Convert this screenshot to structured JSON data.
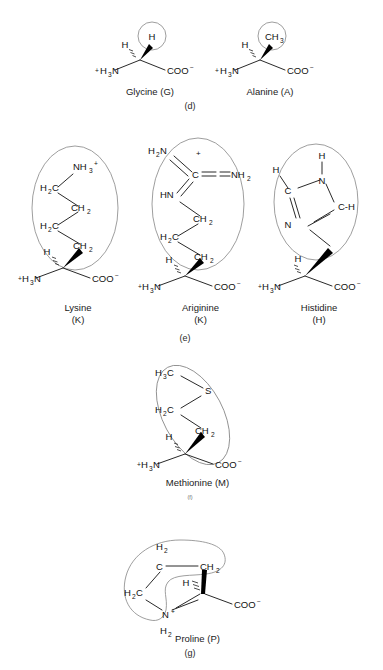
{
  "figure": {
    "background_color": "#ffffff",
    "ink_color": "#111111",
    "outline_color": "#8c8c8c"
  },
  "panels": [
    {
      "id": "d",
      "label": "(d)",
      "group": "Nonpolar / small side chains"
    },
    {
      "id": "e",
      "label": "(e)",
      "group": "Basic side chains"
    },
    {
      "id": "f",
      "label": "(f)",
      "group": "Sulfur-containing side chain"
    },
    {
      "id": "g",
      "label": "(g)",
      "group": "Cyclic imino acid"
    }
  ],
  "molecules": [
    {
      "id": "glycine",
      "name": "Glycine",
      "code": "G",
      "caption": "Glycine (G)",
      "panel": "d",
      "amino_group": "H3N",
      "amino_charge": "+",
      "carboxyl_group": "COO",
      "carboxyl_charge": "−",
      "alpha_hydrogen": "H",
      "side_chain": "H",
      "side_chain_shape": "circle"
    },
    {
      "id": "alanine",
      "name": "Alanine",
      "code": "A",
      "caption": "Alanine (A)",
      "panel": "d",
      "amino_group": "H3N",
      "amino_charge": "+",
      "carboxyl_group": "COO",
      "carboxyl_charge": "−",
      "alpha_hydrogen": "H",
      "side_chain": "CH3",
      "side_chain_shape": "circle"
    },
    {
      "id": "lysine",
      "name": "Lysine",
      "code": "K",
      "caption_line1": "Lysine",
      "caption_line2": "(K)",
      "panel": "e",
      "amino_group": "H3N",
      "amino_charge": "+",
      "carboxyl_group": "COO",
      "carboxyl_charge": "−",
      "alpha_hydrogen": "H",
      "side_chain_shape": "ellipse",
      "side_chain_atoms": [
        "NH3+",
        "H2C",
        "CH2",
        "H2C",
        "CH2"
      ]
    },
    {
      "id": "arginine",
      "name": "Ariginine",
      "code": "K",
      "caption_line1": "Ariginine",
      "caption_line2": "(K)",
      "panel": "e",
      "amino_group": "H3N",
      "amino_charge": "+",
      "carboxyl_group": "COO",
      "carboxyl_charge": "−",
      "alpha_hydrogen": "H",
      "side_chain_shape": "ellipse",
      "side_chain_atoms": [
        "H2N",
        "+",
        "C",
        "NH2",
        "HN",
        "CH2",
        "H2C",
        "CH2"
      ]
    },
    {
      "id": "histidine",
      "name": "Histidine",
      "code": "H",
      "caption_line1": "Histidine",
      "caption_line2": "(H)",
      "panel": "e",
      "amino_group": "H3N",
      "amino_charge": "+",
      "carboxyl_group": "COO",
      "carboxyl_charge": "−",
      "alpha_hydrogen": "H",
      "side_chain_shape": "ellipse",
      "side_chain_atoms": [
        "H",
        "N",
        "H",
        "C",
        "C-H",
        "N"
      ]
    },
    {
      "id": "methionine",
      "name": "Methionine",
      "code": "M",
      "caption": "Methionine (M)",
      "panel": "f",
      "amino_group": "H3N",
      "amino_charge": "+",
      "carboxyl_group": "COO",
      "carboxyl_charge": "−",
      "alpha_hydrogen": "H",
      "side_chain_shape": "ellipse",
      "side_chain_atoms": [
        "H3C",
        "S",
        "H2C",
        "CH2"
      ]
    },
    {
      "id": "proline",
      "name": "Proline",
      "code": "P",
      "caption": "Proline (P)",
      "panel": "g",
      "carboxyl_group": "COO",
      "carboxyl_charge": "−",
      "alpha_hydrogen": "H",
      "side_chain_shape": "kidney",
      "side_chain_atoms": [
        "H2",
        "C",
        "CH2",
        "H2C",
        "N+",
        "H2"
      ]
    }
  ],
  "labels": {
    "H": "H",
    "C": "C",
    "N": "N",
    "S": "S",
    "plus": "+",
    "minus": "−",
    "CH": "C-H",
    "HN": "HN",
    "NH2": "NH2",
    "H2N": "H2N",
    "H2C": "H2C",
    "CH2": "CH2",
    "H3C": "H3C",
    "H3N": "H3N",
    "NH3": "NH3",
    "COO": "COO",
    "H2": "H2",
    "N_plus": "N"
  }
}
